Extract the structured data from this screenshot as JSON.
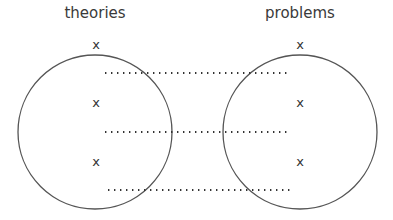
{
  "diagram": {
    "left_set": {
      "title": "theories",
      "marks": [
        "x",
        "x",
        "x"
      ]
    },
    "right_set": {
      "title": "problems",
      "marks": [
        "x",
        "x",
        "x"
      ]
    },
    "connectors": 3,
    "colors": {
      "stroke": "#555555",
      "dots": "#333333"
    }
  }
}
